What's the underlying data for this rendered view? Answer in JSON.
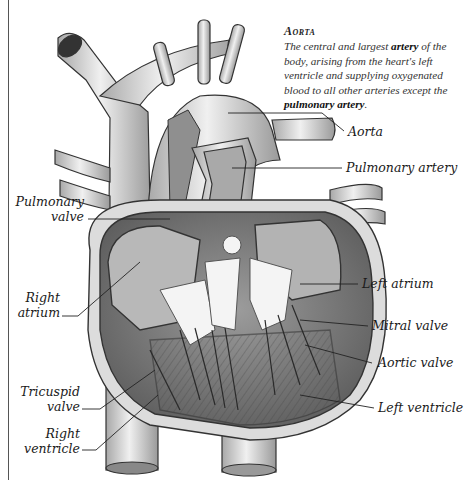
{
  "info_box": {
    "title": "Aorta",
    "body_parts": [
      "The central and largest ",
      "artery",
      " of the body, arising from the heart's left ventricle and supplying oxygenated blood to all other arteries except the ",
      "pulmonary artery",
      "."
    ]
  },
  "labels": {
    "aorta": "Aorta",
    "pulmonary_artery": "Pulmonary artery",
    "pulmonary_valve_line1": "Pulmonary",
    "pulmonary_valve_line2": "valve",
    "right_atrium_line1": "Right",
    "right_atrium_line2": "atrium",
    "left_atrium": "Left atrium",
    "mitral_valve": "Mitral valve",
    "aortic_valve": "Aortic valve",
    "tricuspid_valve_line1": "Tricuspid",
    "tricuspid_valve_line2": "valve",
    "left_ventricle": "Left ventricle",
    "right_ventricle_line1": "Right",
    "right_ventricle_line2": "ventricle"
  },
  "colors": {
    "line": "#222222",
    "vessel_fill": "#d9d9d9",
    "muscle_fill": "#8a8a8a",
    "chamber_fill": "#b5b5b5",
    "valve_fill": "#f4f4f4"
  }
}
